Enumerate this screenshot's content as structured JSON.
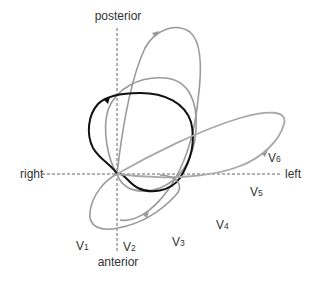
{
  "diagram": {
    "type": "vectorcardiogram-horizontal-plane",
    "axes": {
      "top_label": "posterior",
      "bottom_label": "anterior",
      "left_label": "right",
      "right_label": "left"
    },
    "leads": [
      {
        "letter": "V",
        "sub": "1"
      },
      {
        "letter": "V",
        "sub": "2"
      },
      {
        "letter": "V",
        "sub": "3"
      },
      {
        "letter": "V",
        "sub": "4"
      },
      {
        "letter": "V",
        "sub": "5"
      },
      {
        "letter": "V",
        "sub": "6"
      }
    ],
    "loops": [
      {
        "name": "tall-posterior-loop",
        "color": "#9a9a9a"
      },
      {
        "name": "medium-posterior-loop",
        "color": "#9a9a9a"
      },
      {
        "name": "qrs-main-loop",
        "color": "#111111"
      },
      {
        "name": "leftward-elongated-loop",
        "color": "#a8a8a8"
      },
      {
        "name": "anterior-lower-loop",
        "color": "#9a9a9a"
      }
    ],
    "colors": {
      "axis": "#555555",
      "gray_loop": "#9a9a9a",
      "black_loop": "#111111",
      "text": "#333333",
      "background": "#ffffff"
    }
  }
}
